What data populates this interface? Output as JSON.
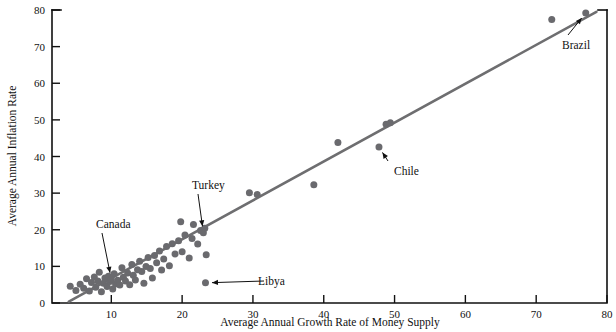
{
  "chart_data": {
    "type": "scatter",
    "title": "",
    "xlabel": "Average Annual Growth Rate of Money Supply",
    "ylabel": "Average Annual Inflation Rate",
    "xlim": [
      0,
      80
    ],
    "ylim": [
      0,
      80
    ],
    "xticks": [
      10,
      20,
      30,
      40,
      50,
      60,
      70,
      80
    ],
    "yticks": [
      0,
      10,
      20,
      30,
      40,
      50,
      60,
      70,
      80
    ],
    "xtick_labels": [
      "10",
      "20",
      "30",
      "40",
      "50",
      "60",
      "70",
      "80"
    ],
    "ytick_labels": [
      "0",
      "10",
      "20",
      "30",
      "40",
      "50",
      "60",
      "70",
      "80"
    ],
    "grid": false,
    "legend": "none",
    "marker_color": "#6a6a6e",
    "trend_color": "#6e6e70",
    "axis_color": "#111111",
    "background_color": "#ffffff",
    "trendline": {
      "type": "line",
      "x": [
        4.0,
        78.5
      ],
      "y": [
        0.4,
        79.5
      ],
      "label": "fitted regression line"
    },
    "points": [
      {
        "x": 4.2,
        "y": 4.6
      },
      {
        "x": 5.0,
        "y": 3.4
      },
      {
        "x": 5.6,
        "y": 5.1
      },
      {
        "x": 6.1,
        "y": 4.0
      },
      {
        "x": 6.5,
        "y": 6.6
      },
      {
        "x": 6.9,
        "y": 3.3
      },
      {
        "x": 7.2,
        "y": 5.6
      },
      {
        "x": 7.6,
        "y": 7.1
      },
      {
        "x": 7.8,
        "y": 4.3
      },
      {
        "x": 8.1,
        "y": 6.0
      },
      {
        "x": 8.3,
        "y": 8.4
      },
      {
        "x": 8.6,
        "y": 3.1
      },
      {
        "x": 8.9,
        "y": 5.4
      },
      {
        "x": 9.1,
        "y": 6.8
      },
      {
        "x": 9.4,
        "y": 4.5
      },
      {
        "x": 9.6,
        "y": 7.3
      },
      {
        "x": 9.8,
        "y": 5.9
      },
      {
        "x": 10.0,
        "y": 6.5
      },
      {
        "x": 10.2,
        "y": 3.8
      },
      {
        "x": 10.4,
        "y": 8.0
      },
      {
        "x": 10.6,
        "y": 5.2
      },
      {
        "x": 10.9,
        "y": 6.2
      },
      {
        "x": 11.2,
        "y": 4.9
      },
      {
        "x": 11.5,
        "y": 9.6
      },
      {
        "x": 11.7,
        "y": 7.0
      },
      {
        "x": 12.0,
        "y": 6.0
      },
      {
        "x": 12.3,
        "y": 8.2
      },
      {
        "x": 12.6,
        "y": 5.0
      },
      {
        "x": 12.9,
        "y": 10.5
      },
      {
        "x": 13.1,
        "y": 7.6
      },
      {
        "x": 13.4,
        "y": 6.3
      },
      {
        "x": 13.7,
        "y": 9.1
      },
      {
        "x": 14.0,
        "y": 11.4
      },
      {
        "x": 14.3,
        "y": 8.6
      },
      {
        "x": 14.6,
        "y": 5.4
      },
      {
        "x": 14.9,
        "y": 10.0
      },
      {
        "x": 15.2,
        "y": 12.4
      },
      {
        "x": 15.5,
        "y": 9.4
      },
      {
        "x": 15.8,
        "y": 6.8
      },
      {
        "x": 16.1,
        "y": 13.0
      },
      {
        "x": 16.4,
        "y": 11.0
      },
      {
        "x": 16.8,
        "y": 14.2
      },
      {
        "x": 17.1,
        "y": 9.0
      },
      {
        "x": 17.4,
        "y": 12.0
      },
      {
        "x": 17.8,
        "y": 15.4
      },
      {
        "x": 18.2,
        "y": 10.2
      },
      {
        "x": 18.6,
        "y": 16.2
      },
      {
        "x": 19.0,
        "y": 13.4
      },
      {
        "x": 19.5,
        "y": 17.0
      },
      {
        "x": 20.0,
        "y": 14.0
      },
      {
        "x": 20.4,
        "y": 18.6
      },
      {
        "x": 21.0,
        "y": 12.3
      },
      {
        "x": 21.6,
        "y": 21.4
      },
      {
        "x": 22.2,
        "y": 16.1
      },
      {
        "x": 22.6,
        "y": 19.8
      },
      {
        "x": 23.0,
        "y": 19.2
      },
      {
        "x": 23.2,
        "y": 20.4
      },
      {
        "x": 23.4,
        "y": 13.2
      },
      {
        "x": 23.3,
        "y": 5.5
      },
      {
        "x": 21.4,
        "y": 17.6
      },
      {
        "x": 19.8,
        "y": 22.2
      },
      {
        "x": 29.5,
        "y": 30.1
      },
      {
        "x": 30.6,
        "y": 29.6
      },
      {
        "x": 38.6,
        "y": 32.3
      },
      {
        "x": 42.0,
        "y": 43.8
      },
      {
        "x": 47.8,
        "y": 42.6
      },
      {
        "x": 48.8,
        "y": 48.8
      },
      {
        "x": 49.4,
        "y": 49.2
      },
      {
        "x": 72.2,
        "y": 77.4
      },
      {
        "x": 77.0,
        "y": 79.2
      }
    ],
    "annotations": [
      {
        "label": "Canada",
        "point_x": 10.0,
        "point_y": 6.5,
        "text_x": 96,
        "text_y": 228
      },
      {
        "label": "Turkey",
        "point_x": 23.0,
        "point_y": 19.2,
        "text_x": 192,
        "text_y": 189
      },
      {
        "label": "Libya",
        "point_x": 23.3,
        "point_y": 5.5,
        "text_x": 258,
        "text_y": 285
      },
      {
        "label": "Chile",
        "point_x": 47.8,
        "point_y": 42.6,
        "text_x": 394,
        "text_y": 175
      },
      {
        "label": "Brazil",
        "point_x": 77.0,
        "point_y": 79.2,
        "text_x": 562,
        "text_y": 49
      }
    ]
  }
}
